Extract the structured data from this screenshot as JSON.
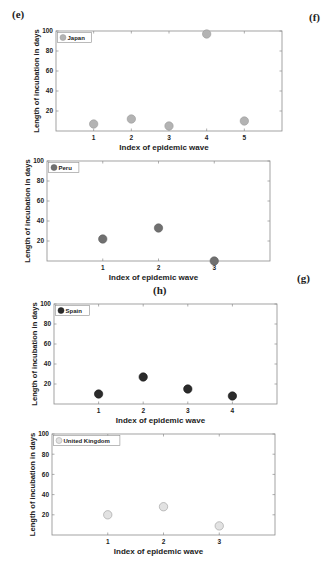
{
  "panel_labels": {
    "e": "(e)",
    "f": "(f)",
    "g": "(g)",
    "h": "(h)"
  },
  "chart_data": [
    {
      "type": "scatter",
      "legend": "Japan",
      "xlabel": "Index of epidemic wave",
      "ylabel": "Length of incubation in days",
      "x": [
        1,
        2,
        3,
        4,
        5
      ],
      "values": [
        7,
        12,
        5,
        97,
        10
      ],
      "xticks": [
        "1",
        "2",
        "3",
        "4",
        "5"
      ],
      "yticks": [
        "20",
        "40",
        "60",
        "80",
        "100"
      ],
      "xlim": [
        0,
        6
      ],
      "ylim": [
        0,
        100
      ],
      "marker_color": "#b3b3b3",
      "marker_edge": "#9a9a9a",
      "legend_position": "upper left",
      "grid": false,
      "frame": {
        "left": 56,
        "top": 31,
        "right": 282,
        "bottom": 131
      }
    },
    {
      "type": "scatter",
      "legend": "Peru",
      "xlabel": "Index of epidemic wave",
      "ylabel": "Length of incubation in days",
      "x": [
        1,
        2,
        3
      ],
      "values": [
        22,
        33,
        0
      ],
      "xticks": [
        "1",
        "2",
        "3"
      ],
      "yticks": [
        "20",
        "40",
        "60",
        "80",
        "100"
      ],
      "xlim": [
        0,
        4
      ],
      "ylim": [
        0,
        100
      ],
      "marker_color": "#707070",
      "marker_edge": "#5e5e5e",
      "legend_position": "upper left",
      "grid": false,
      "frame": {
        "left": 47,
        "top": 161,
        "right": 270,
        "bottom": 261
      }
    },
    {
      "type": "scatter",
      "legend": "Spain",
      "xlabel": "Index of epidemic wave",
      "ylabel": "Length of incubation in days",
      "x": [
        1,
        2,
        3,
        4
      ],
      "values": [
        10,
        27,
        15,
        8
      ],
      "xticks": [
        "1",
        "2",
        "3",
        "4"
      ],
      "yticks": [
        "20",
        "40",
        "60",
        "80",
        "100"
      ],
      "xlim": [
        0,
        5
      ],
      "ylim": [
        0,
        100
      ],
      "marker_color": "#2b2b2b",
      "marker_edge": "#1a1a1a",
      "legend_position": "upper left",
      "grid": false,
      "frame": {
        "left": 54,
        "top": 304,
        "right": 277,
        "bottom": 404
      }
    },
    {
      "type": "scatter",
      "legend": "United Kingdom",
      "xlabel": "Index of epidemic wave",
      "ylabel": "Length of incubation in days",
      "x": [
        1,
        2,
        3
      ],
      "values": [
        20,
        28,
        9
      ],
      "xticks": [
        "1",
        "2",
        "3"
      ],
      "yticks": [
        "20",
        "40",
        "60",
        "80",
        "100"
      ],
      "xlim": [
        0,
        4
      ],
      "ylim": [
        0,
        100
      ],
      "marker_color": "#e2e2e2",
      "marker_edge": "#9a9a9a",
      "legend_position": "upper left",
      "grid": false,
      "frame": {
        "left": 52,
        "top": 434,
        "right": 275,
        "bottom": 535
      }
    }
  ]
}
